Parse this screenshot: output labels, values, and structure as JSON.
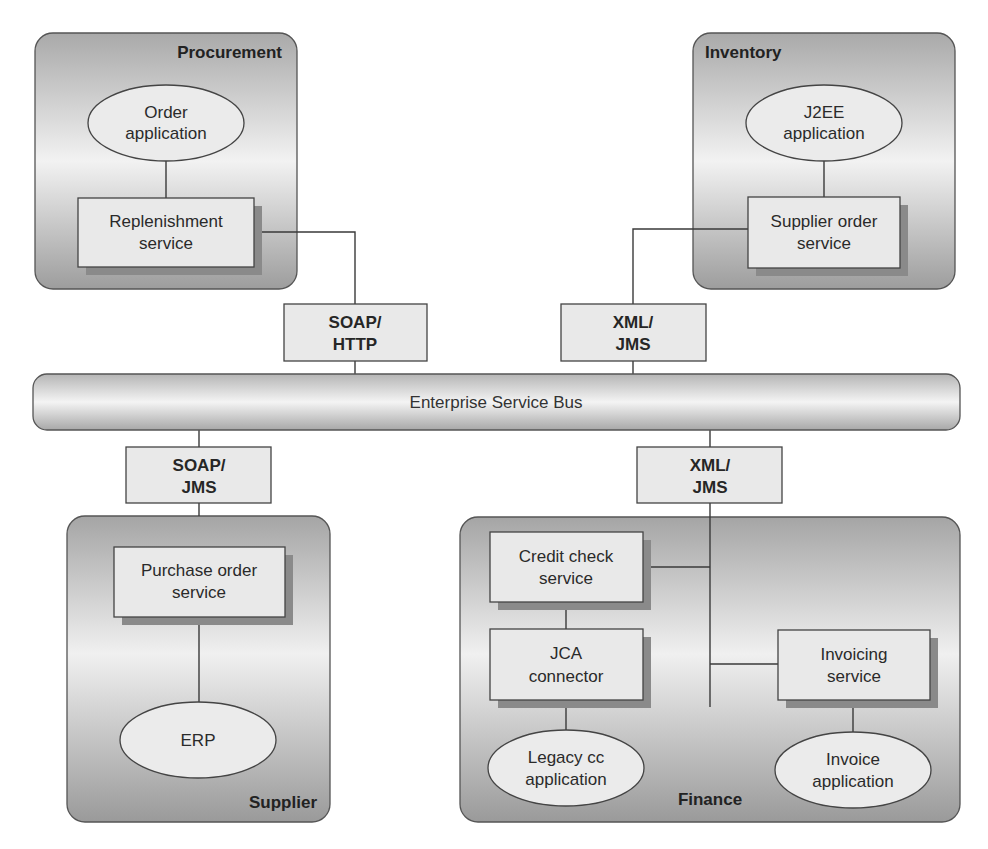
{
  "diagram": {
    "bus": {
      "label": "Enterprise Service Bus"
    },
    "zones": {
      "procurement": {
        "title": "Procurement",
        "application": [
          "Order",
          "application"
        ],
        "service": [
          "Replenishment",
          "service"
        ]
      },
      "inventory": {
        "title": "Inventory",
        "application": [
          "J2EE",
          "application"
        ],
        "service": [
          "Supplier order",
          "service"
        ]
      },
      "supplier": {
        "title": "Supplier",
        "service": [
          "Purchase order",
          "service"
        ],
        "application": [
          "ERP"
        ]
      },
      "finance": {
        "title": "Finance",
        "credit_service": [
          "Credit check",
          "service"
        ],
        "connector": [
          "JCA",
          "connector"
        ],
        "legacy_app": [
          "Legacy cc",
          "application"
        ],
        "invoicing_service": [
          "Invoicing",
          "service"
        ],
        "invoice_app": [
          "Invoice",
          "application"
        ]
      }
    },
    "protocols": {
      "procurement": [
        "SOAP/",
        "HTTP"
      ],
      "inventory": [
        "XML/",
        "JMS"
      ],
      "supplier": [
        "SOAP/",
        "JMS"
      ],
      "finance": [
        "XML/",
        "JMS"
      ]
    }
  }
}
